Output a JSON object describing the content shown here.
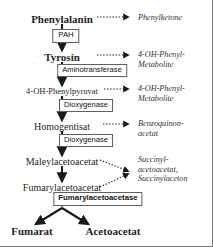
{
  "diagram": {
    "border_color": "#7a7a7a",
    "arrow_color": "#1a1a1a",
    "box_border_color": "#5f5f5f",
    "main_nodes": [
      {
        "id": "phenylalanin",
        "label": "Phenylalanin",
        "style": "bold",
        "x": 62,
        "y": 20
      },
      {
        "id": "tyrosin",
        "label": "Tyrosin",
        "style": "bold",
        "x": 62,
        "y": 58
      },
      {
        "id": "oh-phenylpyruvat",
        "label": "4-OH-Phenylpyruvat",
        "style": "small",
        "x": 62,
        "y": 92
      },
      {
        "id": "homogentisat",
        "label": "Homogentisat",
        "style": "normal",
        "x": 62,
        "y": 127
      },
      {
        "id": "maleylacetoacetat",
        "label": "Maleylacetoacetat",
        "style": "normal",
        "x": 62,
        "y": 162
      },
      {
        "id": "fumarylacetoacetat",
        "label": "Fumarylacetoacetat",
        "style": "normal",
        "x": 62,
        "y": 188
      },
      {
        "id": "fumarat",
        "label": "Fumarat",
        "style": "bold",
        "x": 30,
        "y": 232
      },
      {
        "id": "acetoacetat",
        "label": "Acetoacetat",
        "style": "bold",
        "x": 110,
        "y": 232
      }
    ],
    "enzymes": [
      {
        "id": "pah",
        "label": "PAH",
        "style": "pah",
        "x": 66,
        "y": 33
      },
      {
        "id": "aminotransferase",
        "label": "Aminotransferase",
        "style": "norm",
        "x": 92,
        "y": 68
      },
      {
        "id": "dioxygenase-1",
        "label": "Dioxygenase",
        "style": "norm",
        "x": 86,
        "y": 103
      },
      {
        "id": "dioxygenase-2",
        "label": "Dioxygenase",
        "style": "norm",
        "x": 86,
        "y": 138
      },
      {
        "id": "fumarylacetoacetase",
        "label": "Fumarylacetoacetase",
        "style": "bold",
        "x": 98,
        "y": 196
      }
    ],
    "side_metabolites": [
      {
        "id": "phenylketone",
        "lines": [
          "Phenylketone"
        ],
        "x": 142,
        "y": 17
      },
      {
        "id": "oh-phenyl-metab-1",
        "lines": [
          "4-OH-Phenyl-",
          "Metabolite"
        ],
        "x": 142,
        "y": 54
      },
      {
        "id": "oh-phenyl-metab-2",
        "lines": [
          "4-OH-Phenyl-",
          "Metabolite"
        ],
        "x": 142,
        "y": 88
      },
      {
        "id": "benzoquinonacetat",
        "lines": [
          "Benzoquinon-",
          "acetat"
        ],
        "x": 142,
        "y": 123
      },
      {
        "id": "succinylaceton",
        "lines": [
          "Succinyl-",
          "acetoacetat,",
          "Succinylaceton"
        ],
        "x": 142,
        "y": 158
      }
    ]
  }
}
